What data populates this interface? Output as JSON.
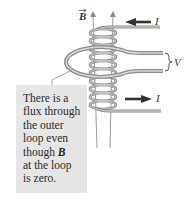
{
  "labels": {
    "field": "B",
    "current_top": "I",
    "current_bottom": "I",
    "voltage": "V"
  },
  "callout": {
    "lines": [
      "There is a",
      "flux through",
      "the outer",
      "loop even",
      "though ",
      "at the loop",
      "is zero."
    ],
    "vector_symbol": "B"
  },
  "colors": {
    "wire": "#8c8c8c",
    "wire_highlight": "#d9d9d9",
    "field_lines": "#9a9a9a",
    "arrow": "#333333",
    "callout_bg": "#e6e6e6",
    "text": "#2a2a2a"
  }
}
